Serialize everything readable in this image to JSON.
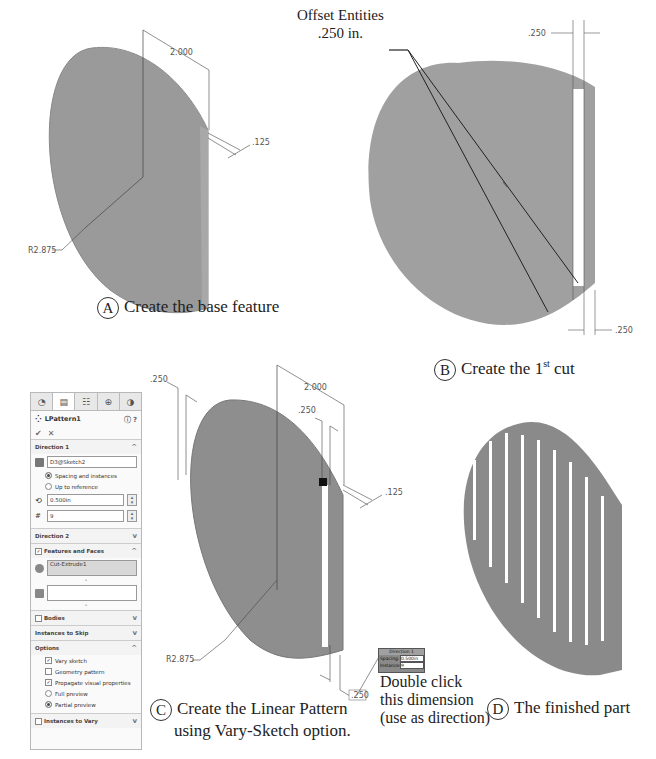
{
  "panel_a": {
    "caption_letter": "A",
    "caption": "Create the base feature",
    "dims": {
      "width": "2.000",
      "thickness": ".125",
      "radius": "R2.875"
    }
  },
  "panel_b": {
    "caption_letter": "B",
    "caption_pre": "Create the 1",
    "caption_sup": "st",
    "caption_post": " cut",
    "callout_line1": "Offset Entities",
    "callout_line2": ".250 in.",
    "dims": {
      "top": ".250",
      "bottom": ".250"
    }
  },
  "panel_c": {
    "caption_letter": "C",
    "caption_line1": "Create the Linear Pattern",
    "caption_line2": "using Vary-Sketch option.",
    "dims": {
      "left": ".250",
      "width": "2.000",
      "slot": ".250",
      "thickness": ".125",
      "radius": "R2.875",
      "direction": ".250"
    },
    "note_line1": "Double click",
    "note_line2": "this dimension",
    "note_line3": "(use as direction)",
    "popup": {
      "title": "Direction 1",
      "spacing_label": "Spacing:",
      "spacing_value": "0.500in",
      "instances_label": "Instances:",
      "instances_value": "9"
    }
  },
  "panel_d": {
    "caption_letter": "D",
    "caption": "The finished part"
  },
  "property_manager": {
    "tabs": [
      {
        "icon": "feature-manager-icon",
        "glyph": "◔"
      },
      {
        "icon": "property-manager-icon",
        "glyph": "▤"
      },
      {
        "icon": "configuration-manager-icon",
        "glyph": "☷"
      },
      {
        "icon": "dimxpert-icon",
        "glyph": "⊕"
      },
      {
        "icon": "display-manager-icon",
        "glyph": "◑"
      }
    ],
    "title": "LPattern1",
    "help_glyph": "ⓧ",
    "ok_glyph": "✔",
    "cancel_glyph": "✕",
    "direction1": {
      "label": "Direction 1",
      "direction_ref": "D3@Sketch2",
      "radio1": "Spacing and instances",
      "radio2": "Up to reference",
      "spacing": "0.500in",
      "instances": "9"
    },
    "direction2": {
      "label": "Direction 2"
    },
    "features": {
      "label": "Features and Faces",
      "item": "Cut-Extrude1"
    },
    "bodies": {
      "label": "Bodies"
    },
    "skip": {
      "label": "Instances to Skip"
    },
    "options": {
      "label": "Options",
      "vary_sketch": "Vary sketch",
      "geometry_pattern": "Geometry pattern",
      "propagate": "Propagate visual properties",
      "full_preview": "Full preview",
      "partial_preview": "Partial preview"
    },
    "vary": {
      "label": "Instances to Vary"
    }
  }
}
